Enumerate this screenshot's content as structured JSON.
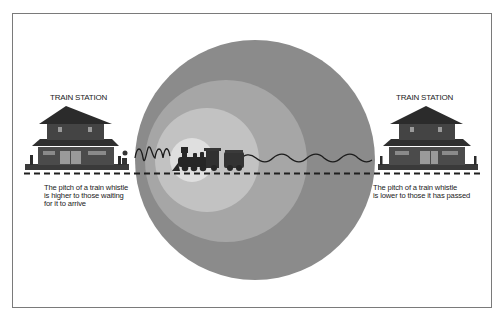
{
  "diagram": {
    "topic": "Doppler effect on a train whistle",
    "left_station": {
      "title": "TRAIN STATION",
      "caption_lines": [
        "The pitch of a train whistle",
        "is higher to those waiting",
        "for it to arrive"
      ]
    },
    "right_station": {
      "title": "TRAIN STATION",
      "caption_lines": [
        "The pitch of a train whistle",
        "is lower to those it has passed"
      ]
    },
    "colors": {
      "wavefront_outer": "#8a8a8a",
      "wavefront_2": "#a4a4a4",
      "wavefront_3": "#c0c0c0",
      "wavefront_inner": "#dedede",
      "train": "#2a2a2a",
      "station_roof": "#2e2e2e",
      "station_wall": "#4a4a4a",
      "wave_line": "#1e1e1e",
      "track": "#222222"
    },
    "icons": {
      "train": "steam-locomotive-icon",
      "station": "station-building-icon"
    }
  }
}
